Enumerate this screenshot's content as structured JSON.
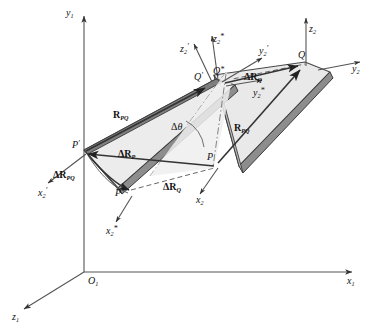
{
  "figure": {
    "background_color": "#ffffff",
    "body_fill_color": "#e8e8e8",
    "body_edge_color": "#4a4a4a",
    "body_dark_face_color": "#8a8a8a",
    "line_color": "#555555",
    "text_color": "#111111"
  },
  "global_frame": {
    "origin_label": "O",
    "origin_sub": "1",
    "axes": [
      {
        "name": "y-axis",
        "label": "y",
        "sub": "1"
      },
      {
        "name": "x-axis",
        "label": "x",
        "sub": "1"
      },
      {
        "name": "z-axis",
        "label": "z",
        "sub": "1"
      }
    ]
  },
  "reference_body": {
    "name": "undeformed-body",
    "point_P_label": "P",
    "point_Q_label": "Q",
    "frame_axes": [
      {
        "name": "z2-axis",
        "label": "z",
        "sub": "2"
      },
      {
        "name": "y2-axis",
        "label": "y",
        "sub": "2"
      },
      {
        "name": "x2-axis",
        "label": "x",
        "sub": "2"
      }
    ],
    "position_vector": {
      "base": "R",
      "sub": "PQ"
    }
  },
  "displaced_body": {
    "name": "displaced-body",
    "point_P_prime_label": "P",
    "point_P_prime_mark": "′",
    "point_Q_prime_label": "Q",
    "point_Q_prime_mark": "′",
    "point_P_star_label": "P",
    "point_P_star_mark": "*",
    "point_Q_star_label": "Q",
    "point_Q_star_mark": "*",
    "frame_axes_prime": [
      {
        "name": "z2-prime-axis",
        "label": "z",
        "sub": "2",
        "mark": "′"
      },
      {
        "name": "y2-prime-axis",
        "label": "y",
        "sub": "2",
        "mark": "′"
      },
      {
        "name": "x2-prime-axis",
        "label": "x",
        "sub": "2",
        "mark": "′"
      }
    ],
    "frame_axes_star": [
      {
        "name": "z2-star-axis",
        "label": "z",
        "sub": "2",
        "mark": "*"
      },
      {
        "name": "y2-star-axis",
        "label": "y",
        "sub": "2",
        "mark": "*"
      },
      {
        "name": "x2-star-axis",
        "label": "x",
        "sub": "2",
        "mark": "*"
      }
    ],
    "position_vector": {
      "base": "R",
      "sub": "PQ"
    }
  },
  "vectors": {
    "delta_R_P": {
      "delta": "Δ",
      "base": "R",
      "sub": "P"
    },
    "delta_R_Q_top": {
      "delta": "Δ",
      "base": "R",
      "sub": "Q"
    },
    "delta_R_Q_bottom": {
      "delta": "Δ",
      "base": "R",
      "sub": "Q"
    },
    "delta_R_PQ": {
      "delta": "Δ",
      "base": "R",
      "sub": "PQ"
    }
  },
  "angle": {
    "name": "rotation-angle",
    "delta": "Δ",
    "symbol": "θ"
  }
}
